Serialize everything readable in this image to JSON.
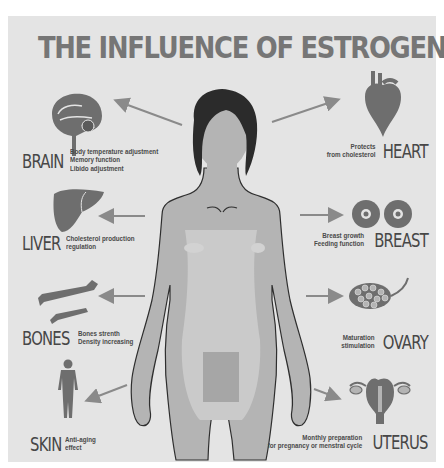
{
  "title": "THE INFLUENCE OF ESTROGEN",
  "colors": {
    "background": "#e4e4e4",
    "title": "#767676",
    "label": "#474747",
    "organ_fill": "#6e6e6e",
    "body_fill": "#b4b4b4",
    "body_highlight": "#cfcfcf",
    "hair": "#2b2b2b",
    "arrow": "#8a8a8a"
  },
  "organs": {
    "brain": {
      "name": "BRAIN",
      "icon": "brain-icon",
      "effects": [
        "Body temperature adjustment",
        "Memory function",
        "Libido adjustment"
      ]
    },
    "heart": {
      "name": "HEART",
      "icon": "heart-icon",
      "effects": [
        "Protects",
        "from cholesterol"
      ]
    },
    "liver": {
      "name": "LIVER",
      "icon": "liver-icon",
      "effects": [
        "Cholesterol production",
        "regulation"
      ]
    },
    "breast": {
      "name": "BREAST",
      "icon": "breast-icon",
      "effects": [
        "Breast growth",
        "Feeding function"
      ]
    },
    "bones": {
      "name": "BONES",
      "icon": "bones-icon",
      "effects": [
        "Bones strenth",
        "Density increasing"
      ]
    },
    "ovary": {
      "name": "OVARY",
      "icon": "ovary-icon",
      "effects": [
        "Maturation",
        "stimulation"
      ]
    },
    "skin": {
      "name": "SKIN",
      "icon": "skin-icon",
      "effects": [
        "Anti-aging",
        "effect"
      ]
    },
    "uterus": {
      "name": "UTERUS",
      "icon": "uterus-icon",
      "effects": [
        "Monthly preparation",
        "for pregnancy or menstral cycle"
      ]
    }
  }
}
